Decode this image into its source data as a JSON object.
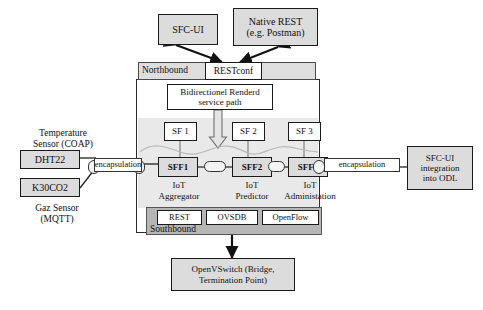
{
  "figure": {
    "colors": {
      "box_fill": "#dcdcdc",
      "box_fill_light": "#efefef",
      "northbound_fill": "#dedede",
      "southbound_fill": "#b6b6b6",
      "panel_shade": "#e9e9e9",
      "stroke": "#1a1a1a",
      "white": "#ffffff"
    }
  },
  "top_clients": {
    "sfc_ui": "SFC-UI",
    "native_rest_line1": "Native REST",
    "native_rest_line2": "(e.g. Postman)"
  },
  "northbound": {
    "label": "Northbound",
    "restconf": "RESTconf"
  },
  "service_path": {
    "line1": "Bidirectionel Renderd",
    "line2": "service path"
  },
  "service_functions": [
    {
      "id": "sf1",
      "label": "SF 1"
    },
    {
      "id": "sf2",
      "label": "SF 2"
    },
    {
      "id": "sf3",
      "label": "SF 3"
    }
  ],
  "forwarders": [
    {
      "id": "sff1",
      "label": "SFF1",
      "role_line1": "IoT",
      "role_line2": "Aggregator"
    },
    {
      "id": "sff2",
      "label": "SFF2",
      "role_line1": "IoT",
      "role_line2": "Predictor"
    },
    {
      "id": "sff3",
      "label": "SFF2",
      "role_line1": "IoT",
      "role_line2": "Administation"
    }
  ],
  "sensors": {
    "temperature_caption_line1": "Temperature",
    "temperature_caption_line2": "Sensor (COAP)",
    "gas_caption_line1": "Gaz Sensor",
    "gas_caption_line2": "(MQTT)",
    "dht22": "DHT22",
    "k30co2": "K30CO2"
  },
  "encapsulation": {
    "left": "encapsulation",
    "right": "encapsulation"
  },
  "odl_integration": {
    "line1": "SFC-UI",
    "line2": "integration",
    "line3": "into ODL"
  },
  "southbound": {
    "label": "Southbound",
    "protocols": [
      {
        "id": "rest",
        "label": "REST"
      },
      {
        "id": "ovsdb",
        "label": "OVSDB"
      },
      {
        "id": "openflow",
        "label": "OpenFlow"
      }
    ]
  },
  "ovs": {
    "line1": "OpenVSwitch (Bridge,",
    "line2": "Termination Point)"
  },
  "icons": {
    "arrow_bidirectional": "arrow-bidirectional-icon",
    "arrow_down": "arrow-down-icon",
    "link_capsule": "link-capsule-icon"
  }
}
